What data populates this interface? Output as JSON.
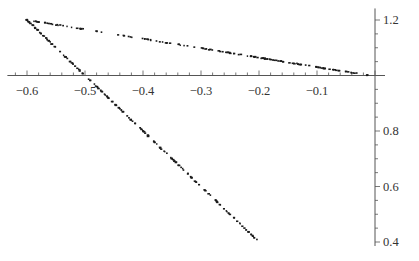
{
  "chart_data": {
    "type": "scatter",
    "title": "",
    "xlabel": "",
    "ylabel": "",
    "xlim": [
      -0.62,
      0.0
    ],
    "ylim": [
      0.4,
      1.22
    ],
    "axes_origin": {
      "x": 0.0,
      "y": 1.0
    },
    "grid": false,
    "legend": null,
    "x_ticks": [
      -0.6,
      -0.5,
      -0.4,
      -0.3,
      -0.2,
      -0.1
    ],
    "x_tick_labels": [
      "−0.6",
      "−0.5",
      "−0.4",
      "−0.3",
      "−0.2",
      "−0.1"
    ],
    "y_ticks": [
      1.2,
      0.8,
      0.6,
      0.4
    ],
    "y_tick_labels": [
      "1.2",
      "0.8",
      "0.6",
      "0.4"
    ],
    "series": [
      {
        "name": "upper-branch",
        "description": "dotted points along a near-straight line",
        "start": {
          "x": -0.6,
          "y": 1.2
        },
        "end": {
          "x": -0.01,
          "y": 1.0
        },
        "n_points": 150
      },
      {
        "name": "lower-branch",
        "description": "dotted points along a near-straight line",
        "start": {
          "x": -0.6,
          "y": 1.2
        },
        "end": {
          "x": -0.2,
          "y": 0.4
        },
        "n_points": 170
      }
    ],
    "point_color": "#1a1a1a",
    "axis_color": "#555555"
  }
}
